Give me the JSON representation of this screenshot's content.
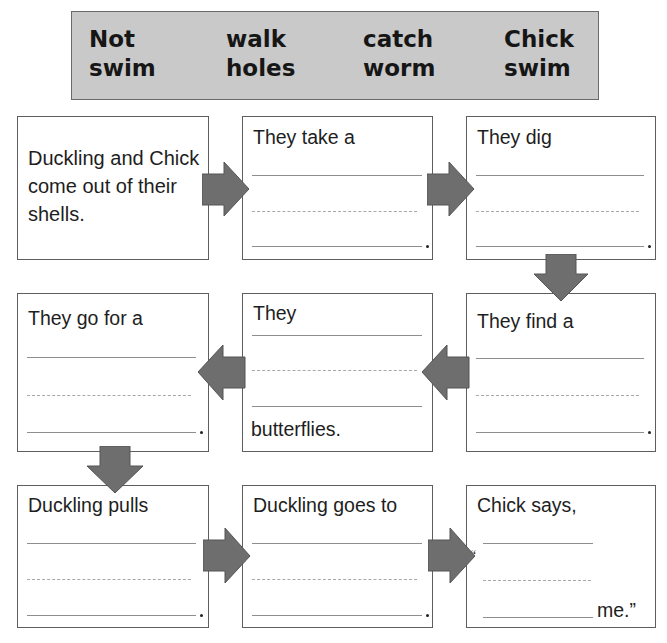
{
  "word_bank": {
    "items": [
      {
        "line1": "Not",
        "line2": "swim"
      },
      {
        "line1": "walk",
        "line2": "holes"
      },
      {
        "line1": "catch",
        "line2": "worm"
      },
      {
        "line1": "Chick",
        "line2": "swim"
      }
    ]
  },
  "sequence": {
    "boxes": [
      {
        "step": 1,
        "text": "Duckling and Chick come out of their shells."
      },
      {
        "step": 2,
        "prompt": "They take a",
        "end_punct": "."
      },
      {
        "step": 3,
        "prompt": "They dig",
        "end_punct": "."
      },
      {
        "step": 4,
        "prompt": "They find a",
        "end_punct": "."
      },
      {
        "step": 5,
        "prompt": "They",
        "suffix": "butterflies."
      },
      {
        "step": 6,
        "prompt": "They go for a",
        "end_punct": "."
      },
      {
        "step": 7,
        "prompt": "Duckling pulls",
        "end_punct": "."
      },
      {
        "step": 8,
        "prompt": "Duckling goes to",
        "end_punct": "."
      },
      {
        "step": 9,
        "prompt": "Chick says,",
        "open_quote": "“",
        "suffix": "me.”"
      }
    ],
    "arrow_color": "#6e6e6e"
  }
}
